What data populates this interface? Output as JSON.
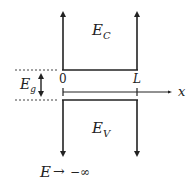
{
  "diagram": {
    "conduction_band": {
      "label": "E",
      "subscript": "C"
    },
    "valence_band": {
      "label": "E",
      "subscript": "V"
    },
    "band_gap": {
      "label": "E",
      "subscript": "g"
    },
    "axis": {
      "label": "x",
      "origin_label": "0",
      "end_label": "L"
    },
    "limit_note": {
      "lhs": "E",
      "arrow": "→",
      "rhs": "−∞"
    },
    "colors": {
      "line": "#222222",
      "dotted": "#444444",
      "background": "#ffffff"
    }
  }
}
